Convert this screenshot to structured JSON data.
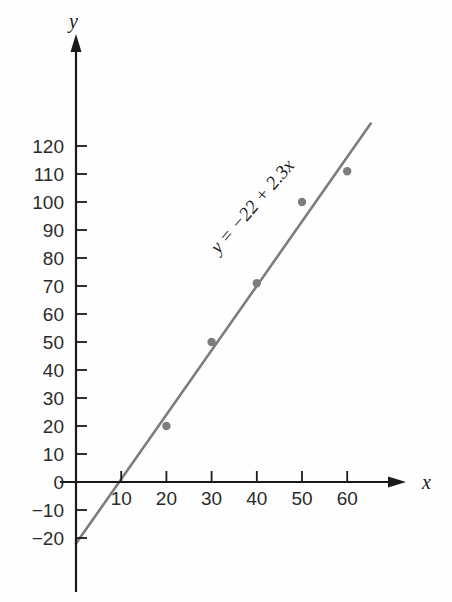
{
  "chart_data": {
    "type": "scatter",
    "title": "",
    "xlabel": "x",
    "ylabel": "y",
    "xlim": [
      0,
      68
    ],
    "ylim": [
      -25,
      128
    ],
    "grid": false,
    "legend": null,
    "x_ticks": [
      10,
      20,
      30,
      40,
      50,
      60
    ],
    "x_tick_labels": [
      "10",
      "20",
      "30",
      "40",
      "50",
      "60"
    ],
    "y_ticks": [
      -20,
      -10,
      0,
      10,
      20,
      30,
      40,
      50,
      60,
      70,
      80,
      90,
      100,
      110,
      120
    ],
    "y_tick_labels": [
      "−20",
      "−10",
      "0",
      "10",
      "20",
      "30",
      "40",
      "50",
      "60",
      "70",
      "80",
      "90",
      "100",
      "110",
      "120"
    ],
    "points": [
      {
        "x": 20,
        "y": 20
      },
      {
        "x": 30,
        "y": 50
      },
      {
        "x": 40,
        "y": 71
      },
      {
        "x": 50,
        "y": 100
      },
      {
        "x": 60,
        "y": 111
      }
    ],
    "series": [
      {
        "name": "regression-line",
        "type": "line",
        "intercept": -22,
        "slope": 2.3,
        "x_start": 0,
        "x_end": 65.2,
        "y_start": -22,
        "y_end": 128
      }
    ],
    "annotations": [
      {
        "name": "equation",
        "text": "y = −22 + 2.3x",
        "x": 40,
        "y": 97,
        "rotation": -49
      }
    ],
    "colors": {
      "line": "#7d7d7d",
      "points": "#7d7d7d",
      "axis": "#1a1a1a",
      "text": "#2b2b2b",
      "background": "#fefefe"
    }
  },
  "axis_labels": {
    "x": "x",
    "y": "y"
  }
}
